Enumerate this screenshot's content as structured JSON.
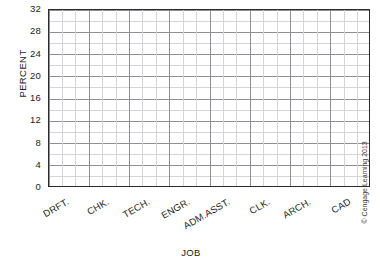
{
  "chart_data": {
    "type": "bar",
    "title": "",
    "subtitle": "",
    "xlabel": "JOB",
    "ylabel": "PERCENT",
    "categories": [
      "DRFT.",
      "CHK.",
      "TECH.",
      "ENGR.",
      "ADM.ASST.",
      "CLK.",
      "ARCH.",
      "CAD"
    ],
    "values": [
      null,
      null,
      null,
      null,
      null,
      null,
      null,
      null
    ],
    "series": [
      {
        "name": "",
        "values": [
          null,
          null,
          null,
          null,
          null,
          null,
          null,
          null
        ]
      }
    ],
    "ylim": [
      0,
      32
    ],
    "y_major_step": 4,
    "y_minor_step": 2,
    "ytick_labels": [
      "0",
      "4",
      "8",
      "12",
      "16",
      "20",
      "24",
      "28",
      "32"
    ],
    "ytick_values": [
      0,
      4,
      8,
      12,
      16,
      20,
      24,
      28,
      32
    ],
    "x_minor_divisions_per_category": 3,
    "grid": true,
    "grid_major_color": "#8e8e96",
    "grid_minor_color": "#d4d4da",
    "axis_color": "#2b2b2b",
    "legend": false,
    "legend_position": "none",
    "annotations": [],
    "note": "blank data-collection grid; no bars plotted"
  },
  "credit": {
    "text": "© Cengage Learning 2013"
  }
}
